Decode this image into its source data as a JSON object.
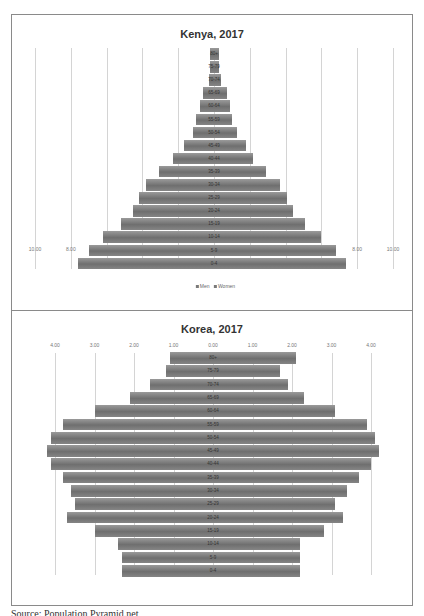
{
  "source": "Source: Population Pyramid.net",
  "chart_data": [
    {
      "type": "bar",
      "orientation": "horizontal",
      "subtype": "population-pyramid",
      "title": "Kenya, 2017",
      "xlabel": "",
      "ylabel": "",
      "x_tick_labels": [
        "10.00",
        "8.00",
        "6.00",
        "4.00",
        "2.00",
        "0.00",
        "2.00",
        "4.00",
        "6.00",
        "8.00",
        "10.00"
      ],
      "xlim": [
        -10,
        10
      ],
      "grid": true,
      "legend": [
        "Men",
        "Women"
      ],
      "legend_position": "bottom",
      "categories": [
        "80+",
        "75-79",
        "70-74",
        "65-69",
        "60-64",
        "55-59",
        "50-54",
        "45-49",
        "40-44",
        "35-39",
        "30-34",
        "25-29",
        "20-24",
        "15-19",
        "10-14",
        "5-9",
        "0-4"
      ],
      "series": [
        {
          "name": "Men",
          "values": [
            0.2,
            0.2,
            0.3,
            0.6,
            0.8,
            1.0,
            1.2,
            1.7,
            2.3,
            3.1,
            3.8,
            4.2,
            4.5,
            5.2,
            6.2,
            7.0,
            7.6
          ]
        },
        {
          "name": "Women",
          "values": [
            0.3,
            0.3,
            0.4,
            0.7,
            0.9,
            1.0,
            1.3,
            1.8,
            2.2,
            2.9,
            3.7,
            4.1,
            4.4,
            5.1,
            6.0,
            6.8,
            7.4
          ]
        }
      ]
    },
    {
      "type": "bar",
      "orientation": "horizontal",
      "subtype": "population-pyramid",
      "title": "Korea, 2017",
      "xlabel": "",
      "ylabel": "",
      "x_tick_labels": [
        "4.00",
        "3.00",
        "2.00",
        "1.00",
        "0.00",
        "1.00",
        "2.00",
        "3.00",
        "4.00"
      ],
      "xlim": [
        -4,
        4
      ],
      "grid": true,
      "legend": [],
      "categories": [
        "80+",
        "75-79",
        "70-74",
        "65-69",
        "60-64",
        "55-59",
        "50-54",
        "45-49",
        "40-44",
        "35-39",
        "30-34",
        "25-29",
        "20-24",
        "15-19",
        "10-14",
        "5-9",
        "0-4"
      ],
      "series": [
        {
          "name": "Men",
          "values": [
            1.1,
            1.2,
            1.6,
            2.1,
            3.0,
            3.8,
            4.1,
            4.2,
            4.1,
            3.8,
            3.6,
            3.5,
            3.7,
            3.0,
            2.4,
            2.3,
            2.3
          ]
        },
        {
          "name": "Women",
          "values": [
            2.1,
            1.7,
            1.9,
            2.3,
            3.1,
            3.9,
            4.1,
            4.2,
            4.0,
            3.7,
            3.4,
            3.1,
            3.3,
            2.8,
            2.2,
            2.2,
            2.2
          ]
        }
      ]
    }
  ]
}
